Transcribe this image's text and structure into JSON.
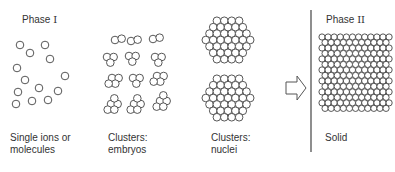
{
  "diagram": {
    "phase1_title": "Phase",
    "phase1_numeral": "I",
    "phase2_title": "Phase",
    "phase2_numeral": "II",
    "stages": [
      {
        "id": "single",
        "label_line1": "Single ions or",
        "label_line2": "molecules"
      },
      {
        "id": "embryos",
        "label_line1": "Clusters:",
        "label_line2": "embryos"
      },
      {
        "id": "nuclei",
        "label_line1": "Clusters:",
        "label_line2": "nuclei"
      },
      {
        "id": "solid",
        "label_line1": "Solid",
        "label_line2": ""
      }
    ],
    "arrow_icon": "hollow-right-arrow",
    "colors": {
      "stroke": "#444444",
      "background": "#ffffff",
      "text": "#333333"
    },
    "particle_radius": 3.8,
    "single_particles": [
      [
        20,
        45
      ],
      [
        30,
        53
      ],
      [
        45,
        45
      ],
      [
        50,
        59
      ],
      [
        17,
        68
      ],
      [
        25,
        80
      ],
      [
        65,
        76
      ],
      [
        18,
        92
      ],
      [
        39,
        88
      ],
      [
        58,
        91
      ],
      [
        32,
        101
      ],
      [
        48,
        100
      ],
      [
        16,
        104
      ]
    ],
    "embryo_clusters": [
      {
        "cx": 115,
        "cy": 40,
        "n": 2
      },
      {
        "cx": 131,
        "cy": 41,
        "n": 2
      },
      {
        "cx": 153,
        "cy": 39,
        "n": 2
      },
      {
        "cx": 107,
        "cy": 57,
        "n": 3
      },
      {
        "cx": 129,
        "cy": 56,
        "n": 3
      },
      {
        "cx": 155,
        "cy": 57,
        "n": 3
      },
      {
        "cx": 112,
        "cy": 78,
        "n": 4
      },
      {
        "cx": 133,
        "cy": 78,
        "n": 3
      },
      {
        "cx": 157,
        "cy": 76,
        "n": 4
      },
      {
        "cx": 111,
        "cy": 104,
        "n": 5
      },
      {
        "cx": 134,
        "cy": 104,
        "n": 5
      },
      {
        "cx": 160,
        "cy": 101,
        "n": 5
      }
    ],
    "nuclei_clusters": [
      {
        "cx": 228,
        "cy": 40,
        "rings": 3
      },
      {
        "cx": 228,
        "cy": 98,
        "rings": 3
      }
    ],
    "solid_lattice": {
      "x0": 322,
      "y0": 37,
      "cols": 12,
      "rows": 14,
      "spacing": 6.1
    }
  }
}
